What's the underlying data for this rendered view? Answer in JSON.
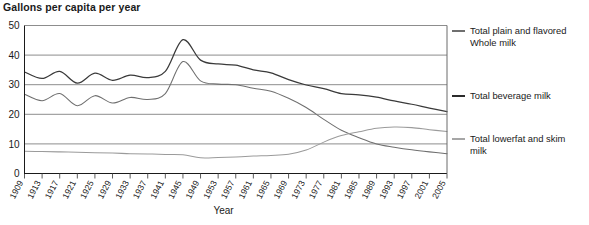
{
  "chart_data": {
    "type": "line",
    "title": "Gallons per capita per year",
    "xlabel": "Year",
    "ylabel": "",
    "xlim": [
      1909,
      2005
    ],
    "ylim": [
      0,
      50
    ],
    "yticks": [
      0,
      10,
      20,
      30,
      40,
      50
    ],
    "grid": true,
    "legend_position": "right",
    "x": [
      1909,
      1913,
      1917,
      1921,
      1925,
      1929,
      1933,
      1937,
      1941,
      1945,
      1949,
      1953,
      1957,
      1961,
      1965,
      1969,
      1973,
      1977,
      1981,
      1985,
      1989,
      1993,
      1997,
      2001,
      2005
    ],
    "xtick_labels": [
      "1909",
      "1913",
      "1917",
      "1921",
      "1925",
      "1929",
      "1933",
      "1937",
      "1941",
      "1945",
      "1949",
      "1953",
      "1957",
      "1961",
      "1965",
      "1969",
      "1973",
      "1977",
      "1981",
      "1985",
      "1989",
      "1993",
      "1997",
      "2001",
      "2005"
    ],
    "series": [
      {
        "name": "Total beverage milk",
        "color": "#3a3a3a",
        "values": [
          34.3,
          32.1,
          34.5,
          30.5,
          33.9,
          31.5,
          33.2,
          32.4,
          34.5,
          45.2,
          38.3,
          37.0,
          36.6,
          35.0,
          34.0,
          31.7,
          29.9,
          28.7,
          27.0,
          26.6,
          25.8,
          24.5,
          23.4,
          22.1,
          20.9
        ]
      },
      {
        "name": "Total plain and flavored Whole milk",
        "color": "#6f6f6f",
        "values": [
          26.8,
          24.6,
          27.0,
          22.9,
          26.3,
          23.8,
          25.7,
          25.0,
          27.0,
          37.8,
          31.3,
          30.2,
          30.0,
          28.8,
          27.8,
          25.4,
          22.3,
          18.3,
          14.6,
          12.1,
          10.0,
          8.9,
          8.0,
          7.3,
          6.7
        ]
      },
      {
        "name": "Total lowerfat and skim milk",
        "color": "#9b9b9b",
        "values": [
          7.5,
          7.4,
          7.3,
          7.2,
          7.0,
          6.9,
          6.7,
          6.6,
          6.4,
          6.3,
          5.3,
          5.4,
          5.6,
          5.9,
          6.1,
          6.5,
          7.9,
          10.6,
          12.8,
          14.1,
          15.3,
          15.7,
          15.5,
          14.8,
          14.2
        ]
      }
    ]
  },
  "legend": {
    "items": [
      {
        "label": "Total plain and flavored\nWhole milk",
        "color": "#6f6f6f",
        "swatch": "legend-line-whole-milk"
      },
      {
        "label": "Total beverage milk",
        "color": "#2b2b2b",
        "swatch": "legend-line-beverage-milk"
      },
      {
        "label": "Total lowerfat and skim\nmilk",
        "color": "#a6a6a6",
        "swatch": "legend-line-lowerfat-milk"
      }
    ]
  }
}
